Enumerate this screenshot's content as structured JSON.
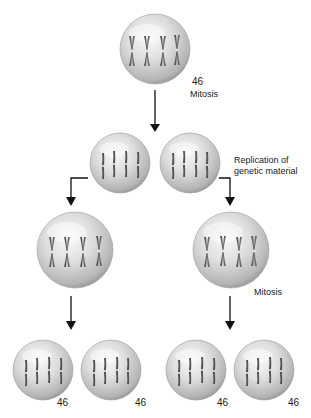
{
  "diagram": {
    "type": "mitosis-cell-division",
    "colors": {
      "cell_light": "#f2f2f2",
      "cell_mid": "#c8c8c8",
      "cell_dark": "#8e8e8e",
      "chromosome": "#5a5a5a",
      "arrow": "#111111",
      "text": "#1a1a1a"
    },
    "parent_cell": {
      "chromosome_count": "46",
      "process_label": "Mitosis"
    },
    "replication_label_line1": "Replication of",
    "replication_label_line2": "genetic material",
    "second_mitosis_label": "Mitosis",
    "daughter_cells": [
      {
        "chromosome_count": "46"
      },
      {
        "chromosome_count": "46"
      },
      {
        "chromosome_count": "46"
      },
      {
        "chromosome_count": "46"
      }
    ],
    "cells": [
      {
        "id": "parent",
        "cx": 155,
        "cy": 49,
        "r": 35,
        "chromosome_style": "duplicated"
      },
      {
        "id": "mid-left",
        "cx": 120,
        "cy": 163,
        "r": 30,
        "chromosome_style": "single"
      },
      {
        "id": "mid-right",
        "cx": 190,
        "cy": 163,
        "r": 30,
        "chromosome_style": "single"
      },
      {
        "id": "large-left",
        "cx": 75,
        "cy": 250,
        "r": 38,
        "chromosome_style": "duplicated"
      },
      {
        "id": "large-right",
        "cx": 231,
        "cy": 250,
        "r": 38,
        "chromosome_style": "duplicated"
      },
      {
        "id": "bottom-1",
        "cx": 43,
        "cy": 370,
        "r": 30,
        "chromosome_style": "single"
      },
      {
        "id": "bottom-2",
        "cx": 111,
        "cy": 370,
        "r": 30,
        "chromosome_style": "single"
      },
      {
        "id": "bottom-3",
        "cx": 196,
        "cy": 370,
        "r": 30,
        "chromosome_style": "single"
      },
      {
        "id": "bottom-4",
        "cx": 264,
        "cy": 370,
        "r": 30,
        "chromosome_style": "single"
      }
    ]
  }
}
